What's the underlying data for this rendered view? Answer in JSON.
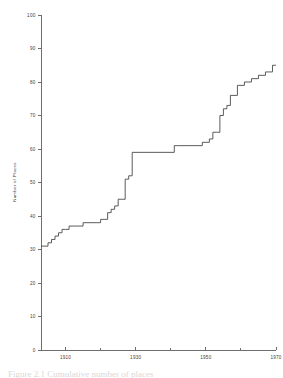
{
  "figure": {
    "background_color": "#ffffff",
    "line_color": "#4a4a4a",
    "axis_color": "#4a4a4a",
    "caption_partial": "Figure 2.1  Cumulative number of places"
  },
  "chart_data": {
    "type": "line",
    "subtype": "step",
    "title": "",
    "xlabel": "",
    "ylabel": "Number of Places",
    "xlim": [
      1903,
      1970
    ],
    "ylim": [
      0,
      100
    ],
    "xticks": [
      1910,
      1930,
      1950,
      1970
    ],
    "xticklabels": [
      "1910",
      "1930",
      "1950",
      "1970"
    ],
    "xminorticks": [
      1920,
      1940,
      1960
    ],
    "yticks": [
      0,
      10,
      20,
      30,
      40,
      50,
      60,
      70,
      80,
      90,
      100
    ],
    "yticklabels": [
      "0",
      "10",
      "20",
      "30",
      "40",
      "50",
      "60",
      "70",
      "80",
      "90",
      "100"
    ],
    "grid": false,
    "legend": false,
    "x": [
      1903,
      1905,
      1906,
      1907,
      1908,
      1909,
      1910,
      1911,
      1913,
      1915,
      1919,
      1920,
      1921,
      1922,
      1923,
      1924,
      1925,
      1926,
      1927,
      1928,
      1929,
      1941,
      1942,
      1949,
      1950,
      1951,
      1952,
      1953,
      1954,
      1955,
      1956,
      1957,
      1959,
      1961,
      1963,
      1965,
      1967,
      1969
    ],
    "y": [
      31,
      32,
      33,
      34,
      35,
      36,
      36,
      37,
      37,
      38,
      38,
      39,
      39,
      41,
      42,
      43,
      45,
      45,
      51,
      52,
      59,
      61,
      61,
      62,
      62,
      63,
      65,
      65,
      70,
      72,
      73,
      76,
      79,
      80,
      81,
      82,
      83,
      85
    ],
    "step_mode": "post",
    "series_name": "Cumulative number of places"
  }
}
